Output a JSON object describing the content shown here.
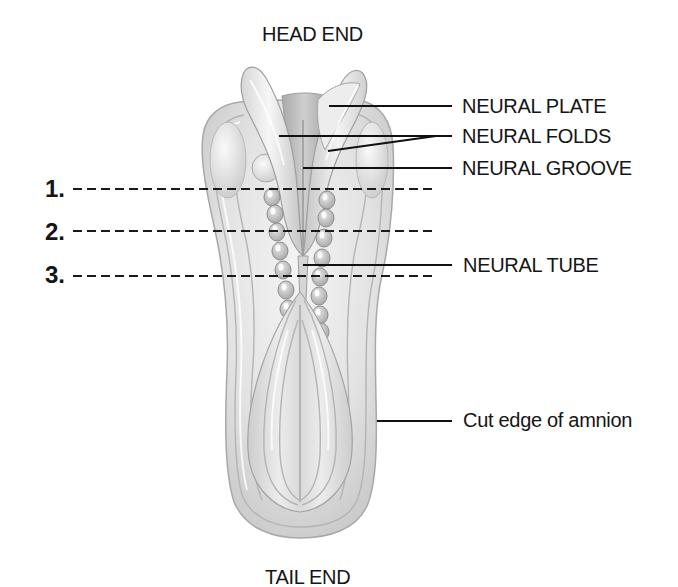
{
  "diagram": {
    "title_top": "HEAD END",
    "title_bottom": "TAIL END",
    "labels": {
      "neural_plate": "NEURAL PLATE",
      "neural_folds": "NEURAL FOLDS",
      "neural_groove": "NEURAL GROOVE",
      "neural_tube": "NEURAL TUBE",
      "amnion": "Cut edge of amnion"
    },
    "section_lines": [
      {
        "number": "1."
      },
      {
        "number": "2."
      },
      {
        "number": "3."
      }
    ]
  },
  "colors": {
    "background": "#ffffff",
    "text": "#151515",
    "embryo_light": "#f2f2f2",
    "embryo_shadow": "#bdbdbd"
  }
}
